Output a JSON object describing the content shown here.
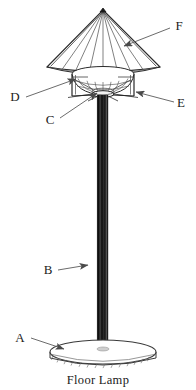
{
  "figure": {
    "caption": "Floor Lamp",
    "title": "Floor Lamp",
    "background_color": "#ffffff",
    "line_color": "#2b2b2b",
    "leader_color": "#555555",
    "pole_color": "#141414",
    "labels": [
      {
        "id": "A",
        "text": "A",
        "target": "base-disc",
        "x": 20,
        "y": 342
      },
      {
        "id": "B",
        "text": "B",
        "target": "pole",
        "x": 48,
        "y": 274
      },
      {
        "id": "C",
        "text": "C",
        "target": "socket-hub",
        "x": 48,
        "y": 124
      },
      {
        "id": "D",
        "text": "D",
        "target": "harp-frame-left",
        "x": 14,
        "y": 101
      },
      {
        "id": "E",
        "text": "E",
        "target": "harp-frame-right",
        "x": 180,
        "y": 103
      },
      {
        "id": "F",
        "text": "F",
        "target": "lamp-shade",
        "x": 178,
        "y": 30
      }
    ],
    "parts": [
      {
        "name": "lamp-shade",
        "label": "F"
      },
      {
        "name": "diffuser-bowl",
        "label": "D"
      },
      {
        "name": "socket-hub",
        "label": "C"
      },
      {
        "name": "harp-frame",
        "label": "E"
      },
      {
        "name": "pole",
        "label": "B"
      },
      {
        "name": "base-disc",
        "label": "A"
      }
    ]
  }
}
